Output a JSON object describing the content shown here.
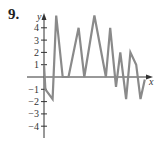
{
  "problem_number": "9.",
  "chart_data": {
    "type": "line",
    "title": "",
    "xlabel": "x",
    "ylabel": "y",
    "ylim": [
      -5,
      5
    ],
    "yticks": [
      -4,
      -3,
      -2,
      -1,
      1,
      2,
      3,
      4
    ],
    "grid": false,
    "legend": null,
    "series": [
      {
        "name": "graph",
        "color": "#8a8a8a",
        "points": [
          [
            0.0,
            1.0
          ],
          [
            0.2,
            -1.0
          ],
          [
            1.2,
            -1.8
          ],
          [
            1.7,
            5.0
          ],
          [
            2.6,
            0.0
          ],
          [
            3.4,
            0.0
          ],
          [
            4.8,
            4.0
          ],
          [
            5.6,
            0.0
          ],
          [
            7.0,
            5.0
          ],
          [
            8.6,
            0.0
          ],
          [
            9.2,
            4.0
          ],
          [
            10.0,
            -0.8
          ],
          [
            10.6,
            2.0
          ],
          [
            11.4,
            -1.8
          ],
          [
            12.0,
            2.0
          ],
          [
            12.8,
            1.0
          ],
          [
            13.4,
            -1.8
          ],
          [
            14.0,
            -0.2
          ]
        ]
      }
    ]
  }
}
